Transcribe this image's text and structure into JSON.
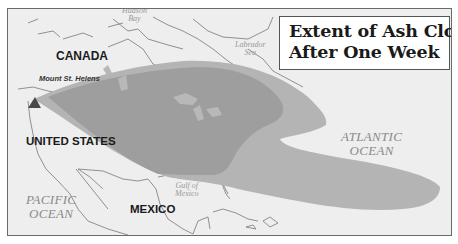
{
  "title": {
    "lines": [
      "Extent of Ash Cloud",
      "After One Week"
    ]
  },
  "labels": {
    "countries": {
      "canada": "CANADA",
      "united_states": "UNITED STATES",
      "mexico": "MEXICO"
    },
    "volcano": "Mount St. Helens",
    "water": {
      "hudson_bay": [
        "Hudson",
        "Bay"
      ],
      "labrador_sea": [
        "Labrador",
        "Sea"
      ],
      "atlantic_ocean": [
        "ATLANTIC",
        "OCEAN"
      ],
      "pacific_ocean": [
        "PACIFIC",
        "OCEAN"
      ],
      "gulf_of_mexico": [
        "Gulf of",
        "Mexico"
      ]
    }
  },
  "colors": {
    "background": "#eeeeee",
    "ash_cloud_over_ocean": "#b4b4b4",
    "ash_cloud_over_land": "#9e9e9e",
    "coastline": "#6f6f6f",
    "volcano_marker": "#4a4a4a"
  },
  "icons": {
    "volcano": "triangle-volcano-marker"
  }
}
